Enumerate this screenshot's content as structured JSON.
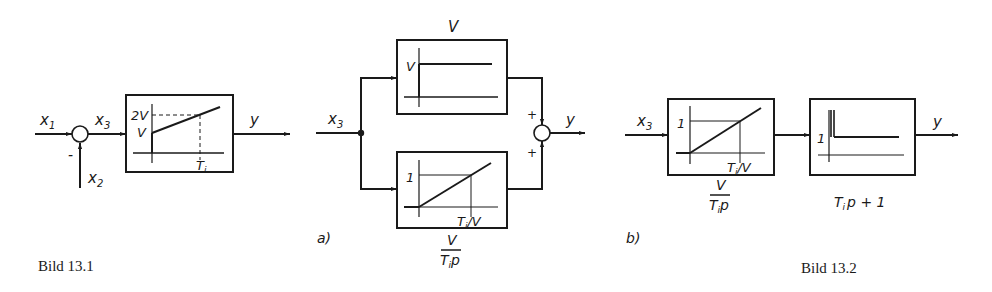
{
  "figure_13_1": {
    "caption": "Bild 13.1",
    "inputs": {
      "x1": "x",
      "x1_sub": "1",
      "x2": "x",
      "x2_sub": "2",
      "x3": "x",
      "x3_sub": "3"
    },
    "sum_sign_minus": "-",
    "output": "y",
    "block": {
      "y_label_upper": "2V",
      "y_label_lower": "V",
      "x_label": "T",
      "x_label_sub": "i"
    }
  },
  "figure_13_2": {
    "caption": "Bild 13.2",
    "part_a": {
      "label": "a)",
      "input": "x",
      "input_sub": "3",
      "output": "y",
      "sign_top": "+",
      "sign_bottom": "+",
      "top_block": {
        "title": "V",
        "y_label": "V"
      },
      "bottom_block": {
        "y_label": "1",
        "x_label": "T",
        "x_label_sub": "i",
        "x_label_suffix": "/V",
        "tf_numerator": "V",
        "tf_denominator": "T",
        "tf_denominator_sub": "i",
        "tf_denominator_suffix": "p"
      }
    },
    "part_b": {
      "label": "b)",
      "input": "x",
      "input_sub": "3",
      "output": "y",
      "block1": {
        "y_label": "1",
        "x_label": "T",
        "x_label_sub": "i",
        "x_label_suffix": "/V",
        "tf_numerator": "V",
        "tf_denominator": "T",
        "tf_denominator_sub": "i",
        "tf_denominator_suffix": "p"
      },
      "block2": {
        "y_label": "1",
        "tf": "T",
        "tf_sub": "i",
        "tf_suffix": "p + 1"
      }
    }
  }
}
